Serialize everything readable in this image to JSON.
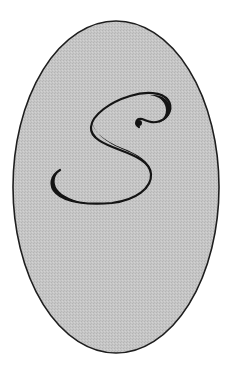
{
  "emblem": {
    "letter": "S",
    "shape": "ellipse",
    "colors": {
      "background": "#ffffff",
      "fill": "#c6c6c6",
      "stipple": "#b4b4b4",
      "outline": "#1e1e1e",
      "letter": "#141414"
    }
  }
}
